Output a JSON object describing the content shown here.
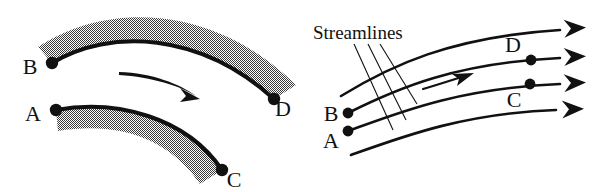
{
  "figure": {
    "background_color": "#ffffff",
    "ink_color": "#111111",
    "band_fill_color": "#8a8a8a",
    "band_texture": "50-percent-checkerboard-stipple"
  },
  "left_panel": {
    "name": "material-line-deformation-panel",
    "labels": [
      {
        "id": "B",
        "text": "B",
        "x": 30,
        "y": 74
      },
      {
        "id": "D",
        "text": "D",
        "x": 281,
        "y": 113
      },
      {
        "id": "A",
        "text": "A",
        "x": 33,
        "y": 124
      },
      {
        "id": "C",
        "text": "C",
        "x": 230,
        "y": 186
      }
    ],
    "points": [
      {
        "id": "B",
        "x": 52,
        "y": 63
      },
      {
        "id": "D",
        "x": 274,
        "y": 99
      },
      {
        "id": "A",
        "x": 56,
        "y": 110
      },
      {
        "id": "C",
        "x": 222,
        "y": 170
      }
    ],
    "flow_arrow": {
      "name": "flow-direction-arrow",
      "from_x": 119,
      "to_x": 197
    }
  },
  "right_panel": {
    "name": "streamlines-panel",
    "annotation": {
      "text": "Streamlines",
      "x": 313,
      "y": 38,
      "leader_count": 3
    },
    "labels": [
      {
        "id": "D",
        "text": "D",
        "x": 511,
        "y": 51
      },
      {
        "id": "C",
        "text": "C",
        "x": 512,
        "y": 107
      },
      {
        "id": "B",
        "text": "B",
        "x": 330,
        "y": 122
      },
      {
        "id": "A",
        "text": "A",
        "x": 330,
        "y": 147
      }
    ],
    "points": [
      {
        "id": "D",
        "x": 531,
        "y": 60
      },
      {
        "id": "C",
        "x": 530,
        "y": 84
      },
      {
        "id": "B",
        "x": 348,
        "y": 113
      },
      {
        "id": "A",
        "x": 348,
        "y": 131
      }
    ],
    "streamline_count": 4,
    "mid_arrow": {
      "name": "mid-flow-arrow",
      "from_x": 423,
      "to_x": 470
    }
  }
}
